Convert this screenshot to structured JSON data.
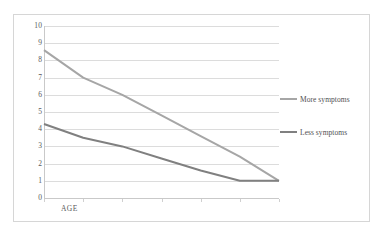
{
  "chart_data": {
    "type": "line",
    "title": "",
    "xlabel": "AGE",
    "ylabel": "",
    "ylim": [
      0,
      10
    ],
    "ytick_step": 1,
    "yticks": [
      "0",
      "1",
      "2",
      "3",
      "4",
      "5",
      "6",
      "7",
      "8",
      "9",
      "10"
    ],
    "grid": true,
    "grid_axis": "y",
    "legend_position": "right",
    "x": [
      1,
      2,
      3,
      4,
      5,
      6,
      7
    ],
    "xticklabels": [
      "",
      "",
      "",
      "",
      "",
      "",
      ""
    ],
    "series": [
      {
        "name": "More symptoms",
        "color": "#a6a6a6",
        "values": [
          8.6,
          7.0,
          6.0,
          4.8,
          3.6,
          2.4,
          1.0
        ]
      },
      {
        "name": "Less symptoms",
        "color": "#808080",
        "values": [
          4.3,
          3.5,
          3.0,
          2.3,
          1.6,
          1.0,
          1.0
        ]
      }
    ]
  },
  "axis": {
    "x_title": "AGE",
    "y_labels": [
      "10",
      "9",
      "8",
      "7",
      "6",
      "5",
      "4",
      "3",
      "2",
      "1",
      "0"
    ]
  },
  "legend": {
    "entries": [
      {
        "label": "More symptoms",
        "color": "#a6a6a6"
      },
      {
        "label": "Less symptoms",
        "color": "#808080"
      }
    ]
  },
  "colors": {
    "more_symptoms": "#a6a6a6",
    "less_symptoms": "#808080",
    "gridline": "#dcdcdc",
    "axis": "#c9c9c9",
    "frame": "#d6d6d6",
    "text": "#59595b",
    "background": "#ffffff"
  }
}
